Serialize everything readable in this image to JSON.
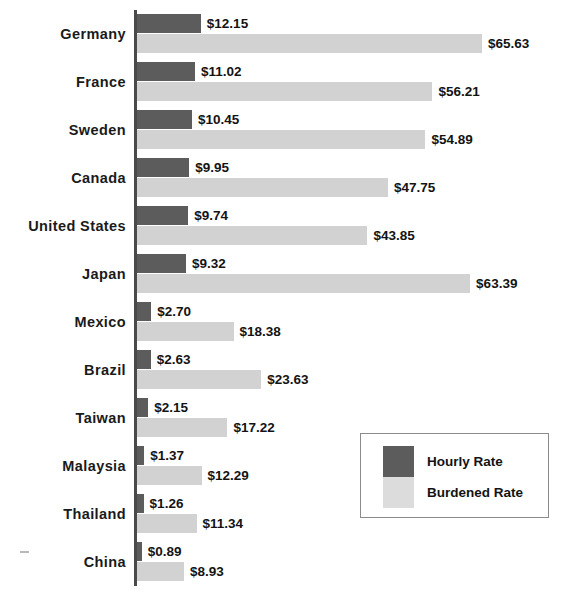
{
  "chart_data": {
    "type": "bar",
    "orientation": "horizontal",
    "title": "",
    "subtitle": "",
    "xlabel": "",
    "ylabel": "",
    "grid": false,
    "axis_visible": true,
    "value_prefix": "$",
    "xlim": [
      0,
      65.63
    ],
    "legend_position": "inside-bottom-right",
    "categories": [
      "Germany",
      "France",
      "Sweden",
      "Canada",
      "United States",
      "Japan",
      "Mexico",
      "Brazil",
      "Taiwan",
      "Malaysia",
      "Thailand",
      "China"
    ],
    "series": [
      {
        "name": "Hourly Rate",
        "color": "#5c5c5c",
        "values": [
          12.15,
          11.02,
          10.45,
          9.95,
          9.74,
          9.32,
          2.7,
          2.63,
          2.15,
          1.37,
          1.26,
          0.89
        ],
        "labels": [
          "$12.15",
          "$11.02",
          "$10.45",
          "$9.95",
          "$9.74",
          "$9.32",
          "$2.70",
          "$2.63",
          "$2.15",
          "$1.37",
          "$1.26",
          "$0.89"
        ]
      },
      {
        "name": "Burdened Rate",
        "color": "#d2d2d2",
        "values": [
          65.63,
          56.21,
          54.89,
          47.75,
          43.85,
          63.39,
          18.38,
          23.63,
          17.22,
          12.29,
          11.34,
          8.93
        ],
        "labels": [
          "$65.63",
          "$56.21",
          "$54.89",
          "$47.75",
          "$43.85",
          "$63.39",
          "$18.38",
          "$23.63",
          "$17.22",
          "$12.29",
          "$11.34",
          "$8.93"
        ]
      }
    ]
  },
  "legend": {
    "entries": [
      {
        "label": "Hourly Rate",
        "swatch": "hourly"
      },
      {
        "label": "Burdened Rate",
        "swatch": "burdened"
      }
    ]
  }
}
